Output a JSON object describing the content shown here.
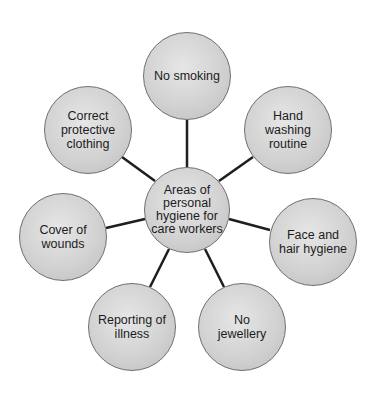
{
  "diagram": {
    "center": {
      "label": "Areas of\npersonal\nhygiene for\ncare workers",
      "cx": 187,
      "cy": 210,
      "r": 43
    },
    "nodes": [
      {
        "id": "no-smoking",
        "label": "No smoking",
        "cx": 187,
        "cy": 76,
        "r": 44
      },
      {
        "id": "hand-washing",
        "label": "Hand\nwashing\nroutine",
        "cx": 288,
        "cy": 130,
        "r": 44
      },
      {
        "id": "face-hair",
        "label": "Face and\nhair hygiene",
        "cx": 313,
        "cy": 242,
        "r": 44
      },
      {
        "id": "no-jewellery",
        "label": "No\njewellery",
        "cx": 242,
        "cy": 327,
        "r": 44
      },
      {
        "id": "reporting-illness",
        "label": "Reporting of\nillness",
        "cx": 132,
        "cy": 327,
        "r": 44
      },
      {
        "id": "cover-wounds",
        "label": "Cover of\nwounds",
        "cx": 63,
        "cy": 237,
        "r": 44
      },
      {
        "id": "protective-clothing",
        "label": "Correct\nprotective\nclothing",
        "cx": 88,
        "cy": 130,
        "r": 44
      }
    ],
    "colors": {
      "line": "#1e1e1e",
      "fill": "#d2d2d2",
      "border": "#6f6f6f"
    }
  }
}
